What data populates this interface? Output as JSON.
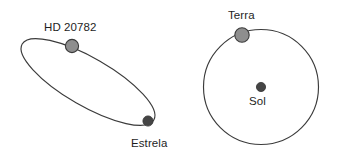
{
  "figure": {
    "background_color": "#ffffff",
    "stroke_color": "#3b3b3b",
    "planet_color": "#8e8e8e",
    "star_color": "#454545",
    "credit": "Reprodução/ACAFE, 2016"
  },
  "left_diagram": {
    "name": "elliptical-orbit",
    "orbit_shape": "ellipse",
    "planet_label": "HD 20782",
    "star_label": "Estrela"
  },
  "right_diagram": {
    "name": "circular-orbit",
    "orbit_shape": "circle",
    "planet_label": "Terra",
    "star_label": "Sol"
  }
}
